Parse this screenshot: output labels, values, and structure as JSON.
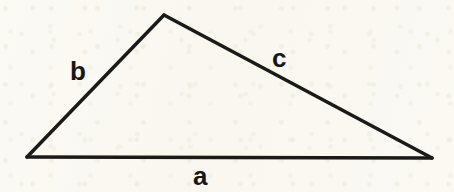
{
  "figure": {
    "kind": "geometry-diagram",
    "width": 454,
    "height": 192,
    "background_color": "#faf8f2",
    "stroke_color": "#1a1a18",
    "label_color": "#171715",
    "stroke_width": 3.5
  },
  "triangle": {
    "vertices": {
      "left": {
        "name": "left-vertex",
        "x": 27,
        "y": 157
      },
      "apex": {
        "name": "apex-vertex",
        "x": 164,
        "y": 15
      },
      "right": {
        "name": "right-vertex",
        "x": 432,
        "y": 158
      }
    },
    "path": "M 27 157 L 164 15 L 432 158 Z",
    "sides": [
      {
        "id": "a",
        "label": "a",
        "from": "left",
        "to": "right",
        "position": "bottom"
      },
      {
        "id": "b",
        "label": "b",
        "from": "left",
        "to": "apex",
        "position": "upper-left"
      },
      {
        "id": "c",
        "label": "c",
        "from": "apex",
        "to": "right",
        "position": "upper-right"
      }
    ]
  },
  "labels": {
    "a": "a",
    "b": "b",
    "c": "c"
  }
}
